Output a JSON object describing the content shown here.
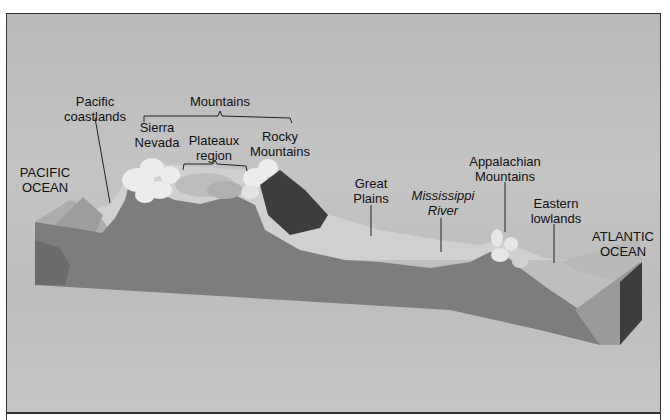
{
  "diagram": {
    "labels": {
      "mountains": "Mountains",
      "pacific_coastlands": [
        "Pacific",
        "coastlands"
      ],
      "sierra_nevada": [
        "Sierra",
        "Nevada"
      ],
      "plateaux_region": [
        "Plateaux",
        "region"
      ],
      "rocky_mountains": [
        "Rocky",
        "Mountains"
      ],
      "pacific_ocean": [
        "PACIFIC",
        "OCEAN"
      ],
      "great_plains": [
        "Great",
        "Plains"
      ],
      "mississippi_river": [
        "Mississippi",
        "River"
      ],
      "appalachian_mountains": [
        "Appalachian",
        "Mountains"
      ],
      "eastern_lowlands": [
        "Eastern",
        "lowlands"
      ],
      "atlantic_ocean": [
        "ATLANTIC",
        "OCEAN"
      ]
    },
    "colors": {
      "background": "#c0c0c0",
      "cross_section": "#7a7a7a",
      "surface": "#d2d2d2",
      "snow_peaks": "#eeeeee",
      "forest": "#3a3a3a",
      "ocean_water": "#a9a9a9",
      "block_side_dark": "#3d3d3d"
    }
  }
}
